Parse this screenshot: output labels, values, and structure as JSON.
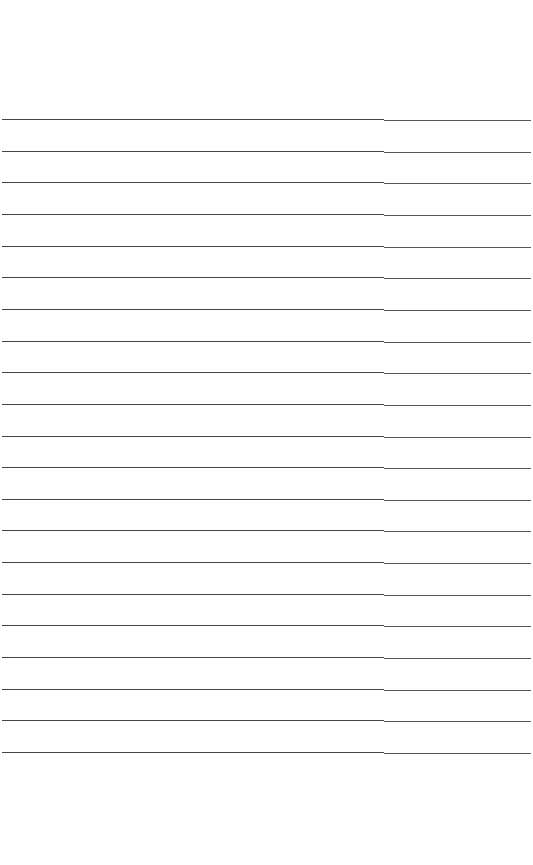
{
  "page": {
    "type": "lined-paper",
    "background": "#fefefe",
    "line_color": "#444444",
    "line_count": 21,
    "first_line_y": 119,
    "line_spacing": 31.65,
    "content_text": ""
  }
}
